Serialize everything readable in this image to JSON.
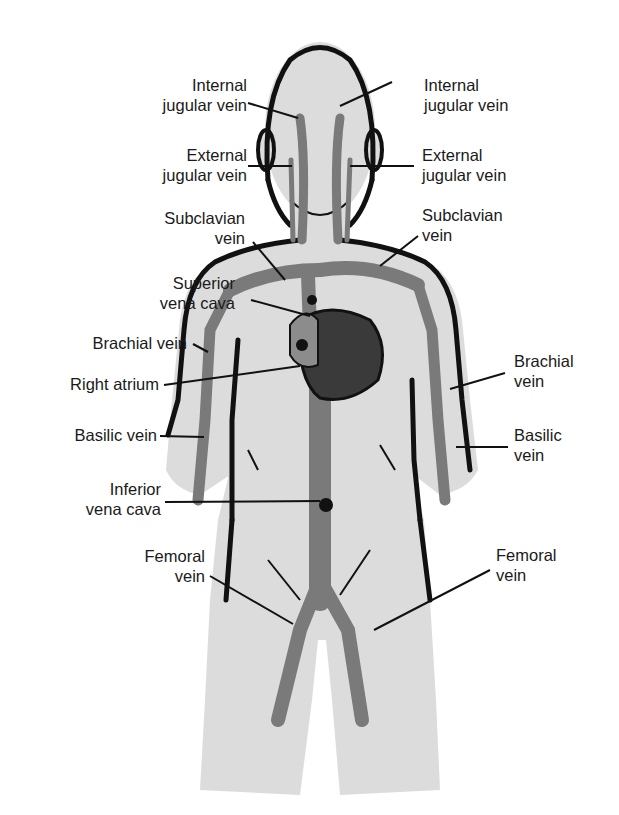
{
  "diagram": {
    "colors": {
      "background": "#ffffff",
      "body_fill": "#dcdcdc",
      "outline": "#111111",
      "vein": "#7a7a7a",
      "heart": "#3a3a3a",
      "atrium": "#8c8c8c",
      "label_text": "#1a1a1a"
    },
    "labels": {
      "left": [
        {
          "id": "internal-jugular-left",
          "lines": [
            "Internal",
            "jugular vein"
          ]
        },
        {
          "id": "external-jugular-left",
          "lines": [
            "External",
            "jugular vein"
          ]
        },
        {
          "id": "subclavian-left",
          "lines": [
            "Subclavian",
            "vein"
          ]
        },
        {
          "id": "superior-vena-cava",
          "lines": [
            "Superior",
            "vena cava"
          ]
        },
        {
          "id": "brachial-left",
          "lines": [
            "Brachial vein"
          ]
        },
        {
          "id": "right-atrium",
          "lines": [
            "Right atrium"
          ]
        },
        {
          "id": "basilic-left",
          "lines": [
            "Basilic vein"
          ]
        },
        {
          "id": "inferior-vena-cava",
          "lines": [
            "Inferior",
            "vena cava"
          ]
        },
        {
          "id": "femoral-left",
          "lines": [
            "Femoral",
            "vein"
          ]
        }
      ],
      "right": [
        {
          "id": "internal-jugular-right",
          "lines": [
            "Internal",
            "jugular vein"
          ]
        },
        {
          "id": "external-jugular-right",
          "lines": [
            "External",
            "jugular vein"
          ]
        },
        {
          "id": "subclavian-right",
          "lines": [
            "Subclavian",
            "vein"
          ]
        },
        {
          "id": "brachial-right",
          "lines": [
            "Brachial",
            "vein"
          ]
        },
        {
          "id": "basilic-right",
          "lines": [
            "Basilic",
            "vein"
          ]
        },
        {
          "id": "femoral-right",
          "lines": [
            "Femoral",
            "vein"
          ]
        }
      ]
    }
  }
}
